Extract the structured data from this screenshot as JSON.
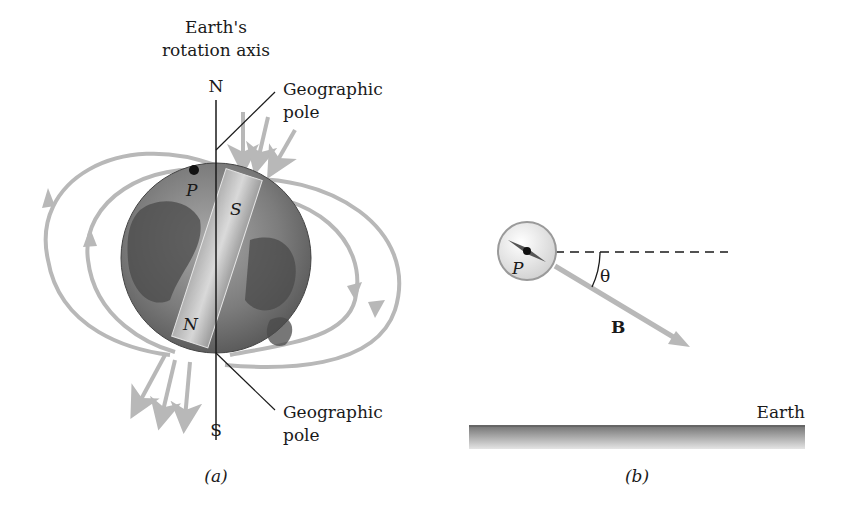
{
  "panel_a": {
    "axis_title_line1": "Earth's",
    "axis_title_line2": "rotation axis",
    "north_label": "N",
    "south_label": "S",
    "geo_pole_top_line1": "Geographic",
    "geo_pole_top_line2": "pole",
    "geo_pole_bottom_line1": "Geographic",
    "geo_pole_bottom_line2": "pole",
    "point_label": "P",
    "magnet_top_label": "S",
    "magnet_bottom_label": "N",
    "caption": "(a)"
  },
  "panel_b": {
    "point_label": "P",
    "angle_label": "θ",
    "field_label": "B",
    "ground_label": "Earth",
    "caption": "(b)"
  },
  "colors": {
    "field_line": "#b8b8b8",
    "globe_dark": "#5a5a5a",
    "globe_light": "#9a9a9a",
    "magnet": "#c8c8c8",
    "ink": "#1a1a1a"
  }
}
